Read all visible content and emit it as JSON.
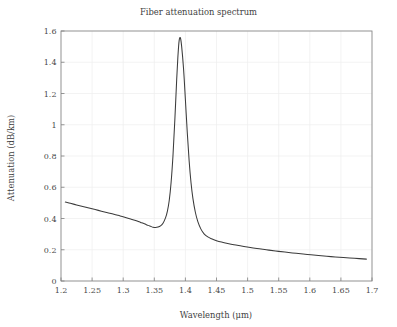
{
  "figure": {
    "width": 397,
    "height": 327,
    "background": "#ffffff",
    "line_color": "#3b3b3b",
    "grid_color": "#eeeeee",
    "axis_color": "#8d8d8d",
    "text_color": "#3f3f3f"
  },
  "chart_data": {
    "type": "line",
    "title": "Fiber attenuation spectrum",
    "xlabel": "Wavelength (μm)",
    "ylabel": "Attenuation (dB/km)",
    "xlim": [
      1.2,
      1.7
    ],
    "ylim": [
      0,
      1.6
    ],
    "xticks": [
      1.2,
      1.25,
      1.3,
      1.35,
      1.4,
      1.45,
      1.5,
      1.55,
      1.6,
      1.65,
      1.7
    ],
    "xticklabels": [
      "1.2",
      "1.25",
      "1.3",
      "1.35",
      "1.4",
      "1.45",
      "1.5",
      "1.55",
      "1.6",
      "1.65",
      "1.7"
    ],
    "yticks": [
      0,
      0.2,
      0.4,
      0.6,
      0.8,
      1.0,
      1.2,
      1.4,
      1.6
    ],
    "yticklabels": [
      "0",
      "0.2",
      "0.4",
      "0.6",
      "0.8",
      "1",
      "1.2",
      "1.4",
      "1.6"
    ],
    "grid": true,
    "legend": false,
    "annotations": {
      "peak_wavelength_um": 1.39,
      "peak_attenuation_db_km": 1.555,
      "local_minimum_wavelength_um": 1.348,
      "local_minimum_attenuation_db_km": 0.34,
      "start_point": [
        1.207,
        0.505
      ],
      "end_point": [
        1.691,
        0.14
      ]
    },
    "series": [
      {
        "name": "attenuation",
        "x": [
          1.207,
          1.215,
          1.225,
          1.235,
          1.245,
          1.255,
          1.265,
          1.275,
          1.285,
          1.295,
          1.305,
          1.312,
          1.32,
          1.328,
          1.334,
          1.34,
          1.344,
          1.348,
          1.352,
          1.356,
          1.36,
          1.364,
          1.368,
          1.371,
          1.374,
          1.377,
          1.38,
          1.383,
          1.386,
          1.388,
          1.39,
          1.392,
          1.394,
          1.397,
          1.4,
          1.403,
          1.406,
          1.409,
          1.412,
          1.416,
          1.42,
          1.425,
          1.43,
          1.436,
          1.442,
          1.45,
          1.458,
          1.468,
          1.478,
          1.49,
          1.502,
          1.515,
          1.53,
          1.545,
          1.56,
          1.578,
          1.596,
          1.614,
          1.634,
          1.654,
          1.672,
          1.691
        ],
        "y": [
          0.505,
          0.497,
          0.487,
          0.477,
          0.467,
          0.457,
          0.447,
          0.437,
          0.427,
          0.416,
          0.405,
          0.397,
          0.387,
          0.375,
          0.366,
          0.356,
          0.35,
          0.344,
          0.342,
          0.345,
          0.353,
          0.37,
          0.404,
          0.446,
          0.515,
          0.63,
          0.8,
          1.03,
          1.29,
          1.44,
          1.54,
          1.555,
          1.5,
          1.36,
          1.16,
          0.95,
          0.77,
          0.63,
          0.53,
          0.44,
          0.38,
          0.332,
          0.302,
          0.282,
          0.27,
          0.258,
          0.249,
          0.24,
          0.232,
          0.224,
          0.216,
          0.208,
          0.2,
          0.192,
          0.185,
          0.177,
          0.17,
          0.163,
          0.156,
          0.15,
          0.145,
          0.14
        ]
      }
    ]
  }
}
